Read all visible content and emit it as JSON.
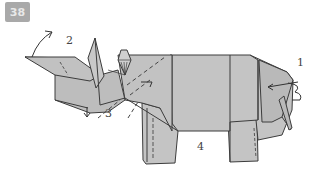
{
  "figure": {
    "step_badge": "38",
    "labels": [
      {
        "id": "step-1",
        "text": "1"
      },
      {
        "id": "step-2",
        "text": "2"
      },
      {
        "id": "step-3",
        "text": "3"
      },
      {
        "id": "step-4",
        "text": "4"
      }
    ],
    "colors": {
      "paper": "#c4c4c4",
      "paper_dark": "#b2b2b2",
      "line": "#3c3c3c",
      "badge": "#a9a9a9"
    }
  }
}
